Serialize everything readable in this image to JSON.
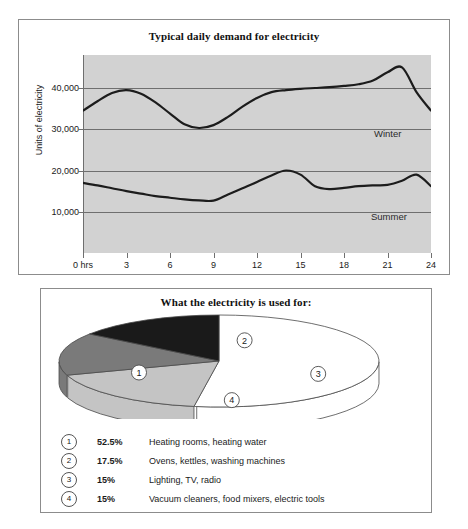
{
  "line_panel": {
    "title": "Typical daily demand for electricity",
    "axis_title": "Units of electricity",
    "y_ticks": [
      "40,000",
      "30,000",
      "20,000",
      "10,000"
    ],
    "x_ticks": [
      "0 hrs",
      "3",
      "6",
      "9",
      "12",
      "15",
      "18",
      "21",
      "24"
    ],
    "winter_label": "Winter",
    "summer_label": "Summer"
  },
  "pie_panel": {
    "title": "What the electricity is used for:",
    "slice_labels": [
      "1",
      "2",
      "3",
      "4"
    ],
    "legend": [
      {
        "num": "1",
        "pct": "52.5%",
        "desc": "Heating rooms, heating water"
      },
      {
        "num": "2",
        "pct": "17.5%",
        "desc": "Ovens, kettles, washing machines"
      },
      {
        "num": "3",
        "pct": "15%",
        "desc": "Lighting, TV, radio"
      },
      {
        "num": "4",
        "pct": "15%",
        "desc": "Vacuum cleaners, food mixers, electric tools"
      }
    ]
  },
  "chart_data": [
    {
      "type": "line",
      "title": "Typical daily demand for electricity",
      "xlabel": "",
      "ylabel": "Units of electricity",
      "xlim": [
        0,
        24
      ],
      "ylim": [
        0,
        48000
      ],
      "grid": true,
      "y_tick_values": [
        40000,
        30000,
        20000,
        10000
      ],
      "x_tick_values": [
        0,
        3,
        6,
        9,
        12,
        15,
        18,
        21,
        24
      ],
      "x_tick_labels": [
        "0 hrs",
        "3",
        "6",
        "9",
        "12",
        "15",
        "18",
        "21",
        "24"
      ],
      "legend_position": "inline-right",
      "x": [
        0,
        1,
        2,
        3,
        4,
        5,
        6,
        7,
        8,
        9,
        10,
        11,
        12,
        13,
        14,
        15,
        16,
        17,
        18,
        19,
        20,
        21,
        22,
        23,
        24
      ],
      "series": [
        {
          "name": "Winter",
          "values": [
            34500,
            36800,
            38800,
            39500,
            38600,
            36500,
            33800,
            31200,
            30300,
            31000,
            33000,
            35500,
            37600,
            39000,
            39500,
            39800,
            40000,
            40200,
            40500,
            40900,
            41800,
            43800,
            45000,
            39000,
            34500
          ]
        },
        {
          "name": "Summer",
          "values": [
            17000,
            16400,
            15700,
            15000,
            14400,
            13800,
            13400,
            13000,
            12750,
            12700,
            14200,
            15700,
            17200,
            18800,
            20000,
            19000,
            16200,
            15500,
            15800,
            16200,
            16400,
            16500,
            17500,
            19000,
            16200
          ]
        }
      ]
    },
    {
      "type": "pie",
      "title": "What the electricity is used for:",
      "labels": [
        "Heating rooms, heating water",
        "Ovens, kettles, washing machines",
        "Lighting, TV, radio",
        "Vacuum cleaners, food mixers, electric tools"
      ],
      "slice_numbers": [
        "1",
        "2",
        "3",
        "4"
      ],
      "values": [
        52.5,
        17.5,
        15,
        15
      ],
      "value_labels": [
        "52.5%",
        "17.5%",
        "15%",
        "15%"
      ],
      "colors": [
        "#ffffff",
        "#c4c4c4",
        "#7a7a7a",
        "#1a1a1a"
      ],
      "style": "3d-ellipse"
    }
  ],
  "colors": {
    "plot_background": "#d2d2d2",
    "gridline": "#6f6f6f",
    "curve": "#1c1c1c",
    "frame": "#8c8c8c",
    "slice_1": "#ffffff",
    "slice_2": "#c4c4c4",
    "slice_3": "#7a7a7a",
    "slice_4": "#1a1a1a"
  }
}
